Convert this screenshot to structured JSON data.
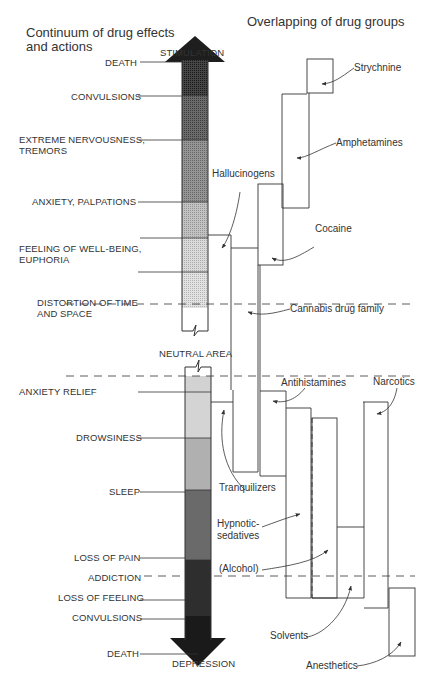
{
  "titles": {
    "left_line1": "Continuum of drug effects",
    "left_line2": "and actions",
    "right": "Overlapping of drug groups"
  },
  "continuum": {
    "top_pole": "STIMULATION",
    "bottom_pole": "DEPRESSION",
    "neutral": "NEUTRAL AREA",
    "stimulation_effects": [
      {
        "label": "DEATH"
      },
      {
        "label": "CONVULSIONS"
      },
      {
        "label": "EXTREME NERVOUSNESS,",
        "label2": "TREMORS"
      },
      {
        "label": "ANXIETY, PALPATIONS"
      },
      {
        "label": "FEELING OF WELL-BEING,",
        "label2": "EUPHORIA"
      },
      {
        "label": "DISTORTION OF TIME",
        "label2": "AND SPACE"
      }
    ],
    "depression_effects": [
      {
        "label": "ANXIETY RELIEF"
      },
      {
        "label": "DROWSINESS"
      },
      {
        "label": "SLEEP"
      },
      {
        "label": "LOSS OF PAIN"
      },
      {
        "label": "ADDICTION"
      },
      {
        "label": "LOSS OF FEELING"
      },
      {
        "label": "CONVULSIONS"
      },
      {
        "label": "DEATH"
      }
    ]
  },
  "drug_groups": [
    {
      "name": "Strychnine"
    },
    {
      "name": "Amphetamines"
    },
    {
      "name": "Hallucinogens"
    },
    {
      "name": "Cocaine"
    },
    {
      "name": "Cannabis drug family"
    },
    {
      "name": "Antihistamines"
    },
    {
      "name": "Narcotics"
    },
    {
      "name": "Tranquilizers"
    },
    {
      "name": "Hypnotic-",
      "name2": "sedatives"
    },
    {
      "name": "(Alcohol)"
    },
    {
      "name": "Solvents"
    },
    {
      "name": "Anesthetics"
    }
  ],
  "colors": {
    "ink": "#333333",
    "black_zone": "#1e1e1e",
    "dark_zone": "#4a4a4a",
    "mid_zone": "#7e7e7e",
    "light_zone": "#b4b4b4",
    "lighter_zone": "#d2d2d2"
  }
}
